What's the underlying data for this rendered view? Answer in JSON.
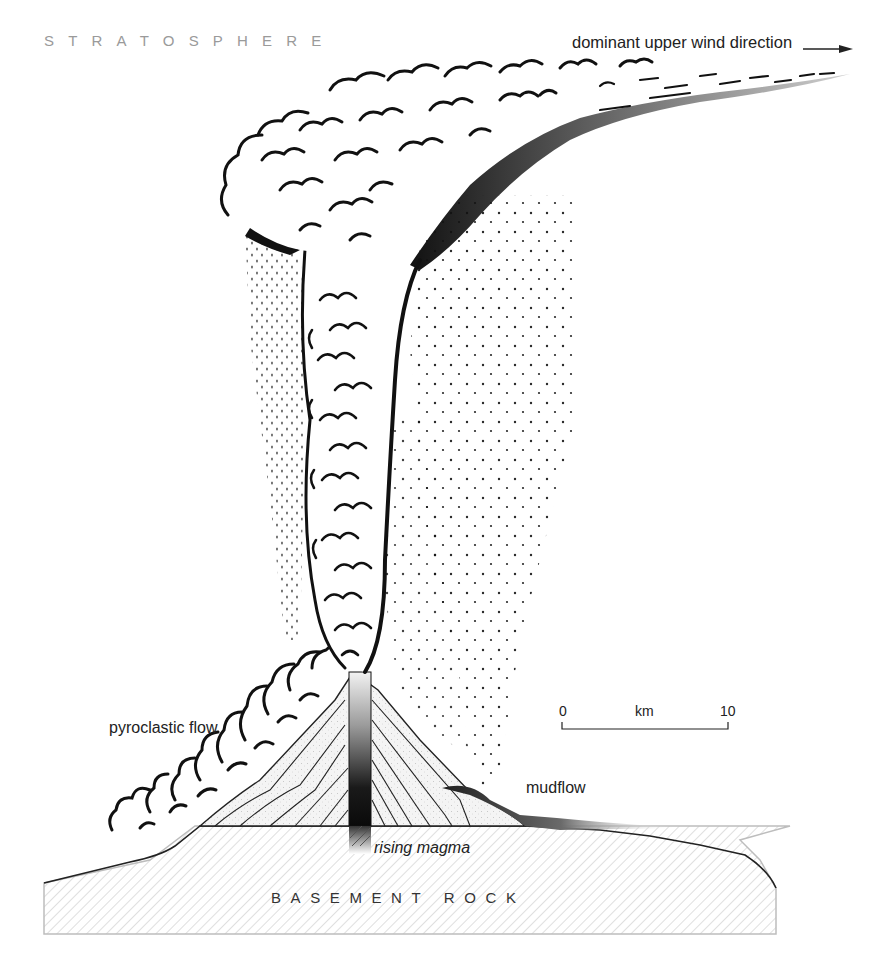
{
  "figure": {
    "labels": {
      "stratosphere": "STRATOSPHERE",
      "wind_direction": "dominant upper wind direction",
      "pyroclastic_flow": "pyroclastic flow",
      "mudflow": "mudflow",
      "rising_magma": "rising magma",
      "basement_rock": "BASEMENT ROCK"
    },
    "scale_bar": {
      "start": "0",
      "unit": "km",
      "end": "10"
    },
    "caption_partial": "... (caption text cut off at bottom edge)"
  },
  "colors": {
    "ink": "#111111",
    "stratosphere_label": "#9a9a9a",
    "basement_hatch": "#c8c8c8",
    "basement_border": "#bdbdbd",
    "cone_fill": "#efefef",
    "conduit_dark": "#111111",
    "conduit_light": "#f0f0f0",
    "mudflow_dark": "#2a2a2a"
  },
  "icons": {
    "wind_arrow": "arrow-right-icon"
  }
}
